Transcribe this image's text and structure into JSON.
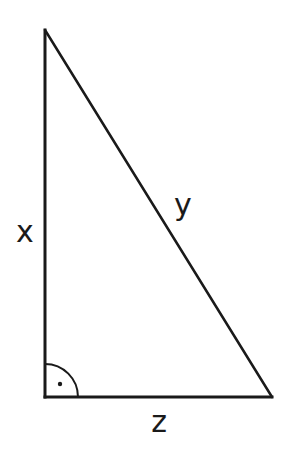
{
  "diagram": {
    "type": "right-triangle",
    "vertices": {
      "top": {
        "x": 45,
        "y": 30
      },
      "right_angle": {
        "x": 45,
        "y": 397
      },
      "bottom_right": {
        "x": 272,
        "y": 397
      }
    },
    "sides": {
      "vertical": {
        "label": "x",
        "label_pos": {
          "x": 25,
          "y": 242
        }
      },
      "hypotenuse": {
        "label": "y",
        "label_pos": {
          "x": 183,
          "y": 215
        }
      },
      "horizontal": {
        "label": "z",
        "label_pos": {
          "x": 159,
          "y": 432
        }
      }
    },
    "right_angle_marker": {
      "arc_radius": 33,
      "dot": {
        "x": 60,
        "y": 384,
        "r": 2.2
      }
    },
    "colors": {
      "stroke": "#1a1a1a",
      "background": "#ffffff"
    }
  }
}
